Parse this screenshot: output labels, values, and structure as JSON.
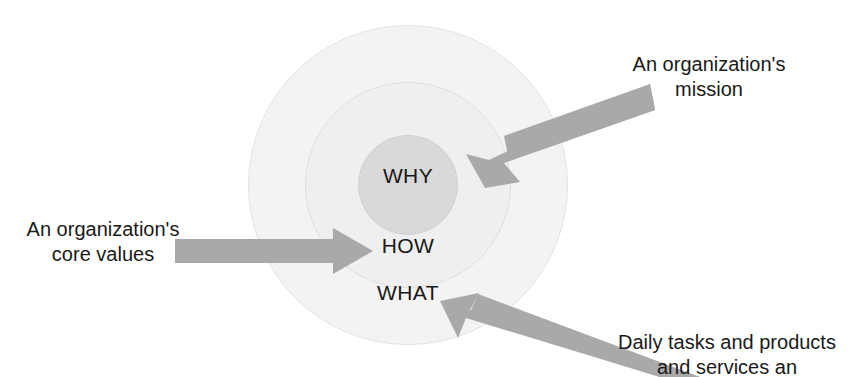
{
  "figure": {
    "kind": "golden-circle-diagram",
    "background_color": "#ffffff",
    "top_cutoff_text_remnant": "(only descenders visible)"
  },
  "circles": {
    "outer": {
      "label": "WHAT",
      "fill_color": "#f3f3f3",
      "stroke_color": "#e3e3e3",
      "center_x": 408,
      "center_y": 185,
      "radius": 160
    },
    "middle": {
      "label": "HOW",
      "fill_color": "#efefef",
      "stroke_color": "#dedede",
      "center_x": 408,
      "center_y": 185,
      "radius": 103
    },
    "inner": {
      "label": "WHY",
      "fill_color": "#d9d9d9",
      "stroke_color": "#cfcfcf",
      "center_x": 408,
      "center_y": 185,
      "radius": 50
    }
  },
  "labels": {
    "why": "WHY",
    "how": "HOW",
    "what": "WHAT"
  },
  "arrows": {
    "color": "#a9a9a9",
    "mission_arrow": {
      "points_to": "WHY",
      "direction": "down-left"
    },
    "core_values_arrow": {
      "points_to": "HOW",
      "direction": "right"
    },
    "daily_tasks_arrow": {
      "points_to": "WHAT",
      "direction": "up-left"
    }
  },
  "callouts": {
    "mission": "An organization's\nmission",
    "core_values": "An organization's\ncore values",
    "daily_tasks": "Daily tasks and products\nand services an"
  }
}
